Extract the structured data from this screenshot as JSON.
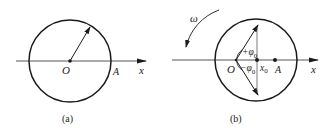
{
  "figures": [
    {
      "id": "a",
      "caption": "(a)",
      "labels": {
        "origin": "O",
        "point": "A",
        "axis": "x"
      }
    },
    {
      "id": "b",
      "caption": "(b)",
      "labels": {
        "origin": "O",
        "point": "A",
        "axis": "x",
        "omega": "ω",
        "plus_phase": "+φ",
        "plus_phase_sub": "0",
        "minus_phase": "−φ",
        "minus_phase_sub": "0",
        "x0": "x",
        "x0_sub": "0"
      }
    }
  ],
  "colors": {
    "stroke": "#1a1a1a",
    "axis": "#444444",
    "background": "#ffffff"
  }
}
